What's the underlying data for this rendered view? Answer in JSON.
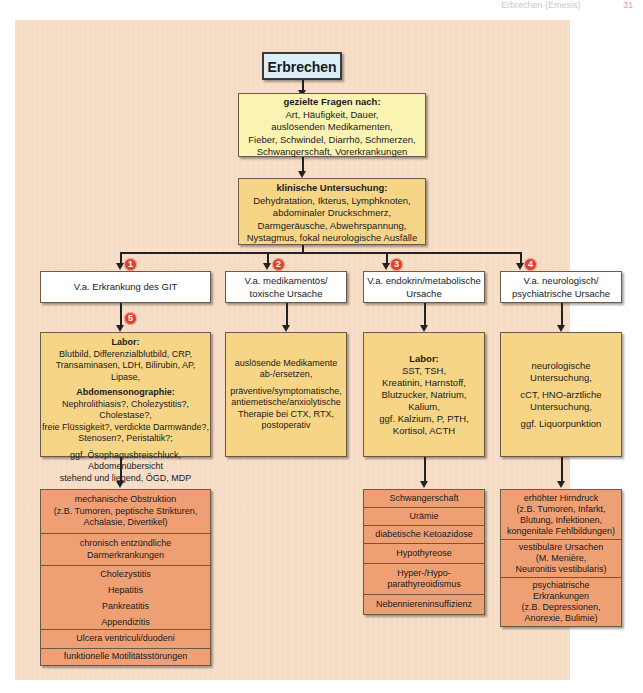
{
  "header": {
    "running_title": "Erbrechen (Emesis)",
    "page_number": "31"
  },
  "flowchart": {
    "root": "Erbrechen",
    "questions": {
      "heading": "gezielte Fragen nach:",
      "lines": [
        "Art, Häufigkeit, Dauer,",
        "auslösenden Medikamenten,",
        "Fieber, Schwindel, Diarrhö, Schmerzen,",
        "Schwangerschaft, Vorerkrankungen"
      ]
    },
    "exam": {
      "heading": "klinische Untersuchung:",
      "lines": [
        "Dehydratation, Ikterus, Lymphknoten,",
        "abdominaler Druckschmerz,",
        "Darmgeräusche, Abwehrspannung,",
        "Nystagmus, fokal neurologische Ausfälle"
      ]
    },
    "branches": [
      {
        "badge": "1",
        "label": "V.a. Erkrankung des GIT",
        "sub_badge": "5",
        "workup": {
          "sections": [
            {
              "heading": "Labor:",
              "lines": [
                "Blutbild, Differenzialblutbild, CRP,",
                "Transaminasen, LDH, Bilirubin, AP, Lipase,"
              ]
            },
            {
              "heading": "Abdomensonographie:",
              "lines": [
                "Nephrolithiasis?, Cholezystitis?, Cholestase?,",
                "freie Flüssigkeit?, verdickte Darmwände?,",
                "Stenosen?, Peristaltik?;"
              ]
            },
            {
              "heading": "",
              "lines": [
                "ggf. Ösophagusbreischluck,",
                "Abdomenübersicht",
                "stehend und liegend, ÖGD, MDP"
              ]
            }
          ]
        },
        "causes": [
          [
            "mechanische Obstruktion",
            "(z.B. Tumoren, peptische Strikturen,",
            "Achalasie, Divertikel)"
          ],
          [
            "chronisch entzündliche",
            "Darmerkrankungen"
          ],
          [
            "Cholezystitis",
            "Hepatitis",
            "Pankreatitis",
            "Appendizitis"
          ],
          [
            "Ulcera ventriculi/duodeni"
          ],
          [
            "funktionelle Motilitätsstörungen"
          ]
        ]
      },
      {
        "badge": "2",
        "label": "V.a. medikamentös/\ntoxische Ursache",
        "label_lines": [
          "V.a. medikamentös/",
          "toxische Ursache"
        ],
        "workup": {
          "sections": [
            {
              "heading": "",
              "lines": [
                "auslösende Medikamente",
                "ab-/ersetzen,"
              ]
            },
            {
              "heading": "",
              "lines": [
                "präventive/symptomatische,",
                "antiemetische/anxiolytische",
                "Therapie bei CTX, RTX,",
                "postoperativ"
              ]
            }
          ]
        }
      },
      {
        "badge": "3",
        "label_lines": [
          "V.a. endokrin/metabolische",
          "Ursache"
        ],
        "workup": {
          "sections": [
            {
              "heading": "Labor:",
              "lines": [
                "SST, TSH,",
                "Kreatinin, Harnstoff,",
                "Blutzucker, Natrium,",
                "Kalium,",
                "ggf. Kalzium, P, PTH,",
                "Kortisol, ACTH"
              ]
            }
          ]
        },
        "causes": [
          [
            "Schwangerschaft"
          ],
          [
            "Urämie"
          ],
          [
            "diabetische Ketoazidose"
          ],
          [
            "Hypothyreose"
          ],
          [
            "Hyper-/Hypo-",
            "parathyreoidismus"
          ],
          [
            "Nebenniereninsuffizienz"
          ]
        ]
      },
      {
        "badge": "4",
        "label_lines": [
          "V.a. neurologisch/",
          "psychiatrische Ursache"
        ],
        "workup": {
          "sections": [
            {
              "heading": "",
              "lines": [
                "neurologische",
                "Untersuchung,"
              ]
            },
            {
              "heading": "",
              "lines": [
                "cCT, HNO-ärztliche",
                "Untersuchung,"
              ]
            },
            {
              "heading": "",
              "lines": [
                "ggf. Liquorpunktion"
              ]
            }
          ]
        },
        "causes": [
          [
            "erhöhter Hirndruck",
            "(z.B. Tumoren, Infarkt,",
            "Blutung, Infektionen,",
            "kongenitale Fehlbildungen)"
          ],
          [
            "vestibuläre Ursachen",
            "(M. Menière,",
            "Neuronitis vestibularis)"
          ],
          [
            "psychiatrische",
            "Erkrankungen",
            "(z.B. Depressionen,",
            "Anorexie, Bulimie)"
          ]
        ]
      }
    ]
  },
  "colors": {
    "panel_bg": "#f6dcc4",
    "root_box": "#dceef7",
    "question_box": "#fbf3b2",
    "workup_box": "#f6d587",
    "cause_box": "#ee9f74",
    "badge": "#d9432e"
  }
}
